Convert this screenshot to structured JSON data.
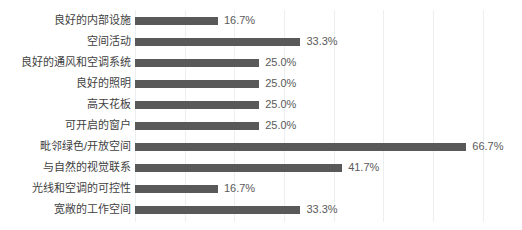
{
  "chart_data": {
    "type": "bar",
    "orientation": "horizontal",
    "title": "",
    "subtitle": "",
    "xlabel": "",
    "ylabel": "",
    "grid": true,
    "legend": false,
    "xlim": [
      0,
      76.5
    ],
    "gridline_interval": 10,
    "value_suffix": "%",
    "bar_color": "#595959",
    "gridline_color": "#eceff1",
    "label_color": "#3f3f3f",
    "value_color": "#5a5a5a",
    "categories": [
      "良好的内部设施",
      "空间活动",
      "良好的通风和空调系统",
      "良好的照明",
      "高天花板",
      "可开启的窗户",
      "毗邻绿色/开放空间",
      "与自然的视觉联系",
      "光线和空调的可控性",
      "宽敞的工作空间"
    ],
    "values": [
      16.7,
      33.3,
      25.0,
      25.0,
      25.0,
      25.0,
      66.7,
      41.7,
      16.7,
      33.3
    ],
    "value_labels": [
      "16.7%",
      "33.3%",
      "25.0%",
      "25.0%",
      "25.0%",
      "25.0%",
      "66.7%",
      "41.7%",
      "16.7%",
      "33.3%"
    ]
  }
}
